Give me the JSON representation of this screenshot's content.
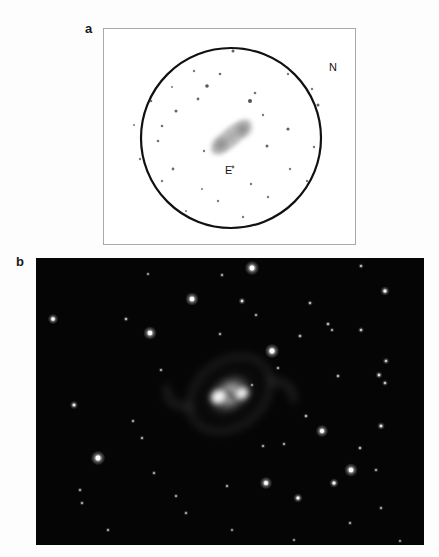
{
  "figure": {
    "panels": [
      {
        "letter": "a",
        "kind": "eyepiece-sketch",
        "frame": {
          "x": 103,
          "y": 28,
          "width": 253,
          "height": 217
        },
        "direction_labels": [
          {
            "name": "north",
            "text": "N",
            "x": 225,
            "y": 33
          },
          {
            "name": "east",
            "text": "E",
            "x": 121,
            "y": 136
          }
        ],
        "field_of_view_circle": {
          "cx": 127,
          "cy": 109,
          "r": 90,
          "stroke": "#111111",
          "stroke_width": 2.2
        },
        "background": "#ffffff",
        "nebula": {
          "name": "bipolar-nebula-sketch",
          "cx": 127,
          "cy": 108,
          "length": 62,
          "width": 26,
          "angle_deg": -41,
          "ink": "#8d8d8d"
        },
        "stars": [
          {
            "x": 129,
            "y": 22,
            "r": 1.5,
            "mag": 0.85
          },
          {
            "x": 90,
            "y": 42,
            "r": 1.2,
            "mag": 0.55
          },
          {
            "x": 116,
            "y": 45,
            "r": 1.3,
            "mag": 0.7
          },
          {
            "x": 184,
            "y": 45,
            "r": 1.2,
            "mag": 0.55
          },
          {
            "x": 68,
            "y": 58,
            "r": 1.1,
            "mag": 0.5
          },
          {
            "x": 103,
            "y": 57,
            "r": 1.8,
            "mag": 0.95
          },
          {
            "x": 208,
            "y": 60,
            "r": 1.2,
            "mag": 0.55
          },
          {
            "x": 47,
            "y": 72,
            "r": 1.3,
            "mag": 0.65
          },
          {
            "x": 94,
            "y": 70,
            "r": 1.4,
            "mag": 0.75
          },
          {
            "x": 151,
            "y": 64,
            "r": 1.3,
            "mag": 0.6
          },
          {
            "x": 146,
            "y": 72,
            "r": 2.0,
            "mag": 1.0
          },
          {
            "x": 214,
            "y": 76,
            "r": 1.5,
            "mag": 0.8
          },
          {
            "x": 72,
            "y": 82,
            "r": 1.5,
            "mag": 0.8
          },
          {
            "x": 30,
            "y": 96,
            "r": 1.1,
            "mag": 0.5
          },
          {
            "x": 58,
            "y": 97,
            "r": 1.3,
            "mag": 0.65
          },
          {
            "x": 159,
            "y": 86,
            "r": 1.2,
            "mag": 0.55
          },
          {
            "x": 184,
            "y": 100,
            "r": 1.6,
            "mag": 0.85
          },
          {
            "x": 54,
            "y": 112,
            "r": 1.3,
            "mag": 0.65
          },
          {
            "x": 163,
            "y": 117,
            "r": 1.5,
            "mag": 0.8
          },
          {
            "x": 210,
            "y": 118,
            "r": 1.2,
            "mag": 0.55
          },
          {
            "x": 36,
            "y": 130,
            "r": 1.2,
            "mag": 0.55
          },
          {
            "x": 100,
            "y": 122,
            "r": 1.2,
            "mag": 0.55
          },
          {
            "x": 69,
            "y": 140,
            "r": 1.4,
            "mag": 0.75
          },
          {
            "x": 129,
            "y": 138,
            "r": 1.4,
            "mag": 0.7
          },
          {
            "x": 186,
            "y": 140,
            "r": 1.2,
            "mag": 0.55
          },
          {
            "x": 58,
            "y": 152,
            "r": 1.2,
            "mag": 0.55
          },
          {
            "x": 98,
            "y": 160,
            "r": 1.1,
            "mag": 0.5
          },
          {
            "x": 147,
            "y": 155,
            "r": 1.2,
            "mag": 0.55
          },
          {
            "x": 203,
            "y": 152,
            "r": 1.2,
            "mag": 0.55
          },
          {
            "x": 114,
            "y": 172,
            "r": 1.2,
            "mag": 0.55
          },
          {
            "x": 164,
            "y": 168,
            "r": 1.2,
            "mag": 0.55
          },
          {
            "x": 82,
            "y": 182,
            "r": 1.1,
            "mag": 0.45
          },
          {
            "x": 139,
            "y": 188,
            "r": 1.2,
            "mag": 0.55
          }
        ]
      },
      {
        "letter": "b",
        "kind": "ccd-photograph",
        "frame": {
          "x": 36,
          "y": 258,
          "width": 388,
          "height": 287
        },
        "background": "#050505",
        "nebula": {
          "name": "bipolar-nebula-photo",
          "cx": 194,
          "cy": 136,
          "core_length": 46,
          "core_width": 34,
          "angle_deg": -38,
          "bright_lobe_a": {
            "x": 182,
            "y": 124,
            "r": 13
          },
          "bright_lobe_b": {
            "x": 204,
            "y": 150,
            "r": 12
          },
          "outer_loop_rx": 46,
          "outer_loop_ry": 34
        },
        "stars": [
          {
            "x": 216,
            "y": 10,
            "r": 2.8,
            "mag": 0.95
          },
          {
            "x": 186,
            "y": 17,
            "r": 1.0,
            "mag": 0.35
          },
          {
            "x": 112,
            "y": 16,
            "r": 0.9,
            "mag": 0.3
          },
          {
            "x": 325,
            "y": 8,
            "r": 1.1,
            "mag": 0.4
          },
          {
            "x": 156,
            "y": 41,
            "r": 2.6,
            "mag": 0.92
          },
          {
            "x": 274,
            "y": 45,
            "r": 1.1,
            "mag": 0.4
          },
          {
            "x": 206,
            "y": 43,
            "r": 1.4,
            "mag": 0.55
          },
          {
            "x": 349,
            "y": 33,
            "r": 1.8,
            "mag": 0.72
          },
          {
            "x": 17,
            "y": 61,
            "r": 2.0,
            "mag": 0.82
          },
          {
            "x": 220,
            "y": 57,
            "r": 1.0,
            "mag": 0.35
          },
          {
            "x": 90,
            "y": 61,
            "r": 1.1,
            "mag": 0.4
          },
          {
            "x": 292,
            "y": 66,
            "r": 1.1,
            "mag": 0.42
          },
          {
            "x": 114,
            "y": 75,
            "r": 2.6,
            "mag": 0.92
          },
          {
            "x": 184,
            "y": 76,
            "r": 1.0,
            "mag": 0.35
          },
          {
            "x": 264,
            "y": 78,
            "r": 1.1,
            "mag": 0.4
          },
          {
            "x": 325,
            "y": 72,
            "r": 1.2,
            "mag": 0.45
          },
          {
            "x": 236,
            "y": 93,
            "r": 2.8,
            "mag": 0.98
          },
          {
            "x": 296,
            "y": 72,
            "r": 1.0,
            "mag": 0.35
          },
          {
            "x": 350,
            "y": 103,
            "r": 1.3,
            "mag": 0.48
          },
          {
            "x": 125,
            "y": 112,
            "r": 1.0,
            "mag": 0.35
          },
          {
            "x": 242,
            "y": 110,
            "r": 1.0,
            "mag": 0.35
          },
          {
            "x": 302,
            "y": 118,
            "r": 1.1,
            "mag": 0.4
          },
          {
            "x": 343,
            "y": 117,
            "r": 1.4,
            "mag": 0.52
          },
          {
            "x": 349,
            "y": 125,
            "r": 1.2,
            "mag": 0.46
          },
          {
            "x": 216,
            "y": 127,
            "r": 0.9,
            "mag": 0.3
          },
          {
            "x": 38,
            "y": 147,
            "r": 1.6,
            "mag": 0.62
          },
          {
            "x": 97,
            "y": 163,
            "r": 1.0,
            "mag": 0.35
          },
          {
            "x": 270,
            "y": 158,
            "r": 1.1,
            "mag": 0.4
          },
          {
            "x": 106,
            "y": 180,
            "r": 1.0,
            "mag": 0.35
          },
          {
            "x": 286,
            "y": 173,
            "r": 2.4,
            "mag": 0.88
          },
          {
            "x": 62,
            "y": 200,
            "r": 2.8,
            "mag": 0.98
          },
          {
            "x": 227,
            "y": 188,
            "r": 1.0,
            "mag": 0.35
          },
          {
            "x": 324,
            "y": 190,
            "r": 1.1,
            "mag": 0.4
          },
          {
            "x": 248,
            "y": 186,
            "r": 1.0,
            "mag": 0.32
          },
          {
            "x": 44,
            "y": 232,
            "r": 1.0,
            "mag": 0.35
          },
          {
            "x": 345,
            "y": 168,
            "r": 1.5,
            "mag": 0.56
          },
          {
            "x": 46,
            "y": 245,
            "r": 1.0,
            "mag": 0.35
          },
          {
            "x": 118,
            "y": 215,
            "r": 1.0,
            "mag": 0.35
          },
          {
            "x": 298,
            "y": 225,
            "r": 1.8,
            "mag": 0.7
          },
          {
            "x": 315,
            "y": 212,
            "r": 2.6,
            "mag": 0.92
          },
          {
            "x": 340,
            "y": 212,
            "r": 1.0,
            "mag": 0.35
          },
          {
            "x": 191,
            "y": 228,
            "r": 1.0,
            "mag": 0.35
          },
          {
            "x": 230,
            "y": 225,
            "r": 2.4,
            "mag": 0.86
          },
          {
            "x": 262,
            "y": 240,
            "r": 1.8,
            "mag": 0.72
          },
          {
            "x": 140,
            "y": 238,
            "r": 1.0,
            "mag": 0.32
          },
          {
            "x": 150,
            "y": 255,
            "r": 1.0,
            "mag": 0.32
          },
          {
            "x": 345,
            "y": 250,
            "r": 1.0,
            "mag": 0.32
          },
          {
            "x": 314,
            "y": 265,
            "r": 1.0,
            "mag": 0.32
          },
          {
            "x": 72,
            "y": 272,
            "r": 1.0,
            "mag": 0.32
          },
          {
            "x": 196,
            "y": 272,
            "r": 0.9,
            "mag": 0.28
          },
          {
            "x": 364,
            "y": 283,
            "r": 0.9,
            "mag": 0.28
          },
          {
            "x": 258,
            "y": 282,
            "r": 0.9,
            "mag": 0.28
          }
        ]
      }
    ]
  },
  "colors": {
    "page_background": "#fdfdfd",
    "panel_a_background": "#ffffff",
    "panel_a_border": "#a9a9a9",
    "panel_b_background": "#050505",
    "ink": "#111111",
    "sketch_star": "#4a4a4a",
    "photo_star": "#ffffff"
  }
}
